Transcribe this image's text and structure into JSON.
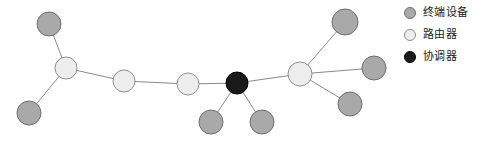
{
  "colors": {
    "end_device_fill": "#a9a9a9",
    "end_device_stroke": "#6e6e6e",
    "router_fill": "#ededed",
    "router_stroke": "#8f8f8f",
    "coordinator_fill": "#1a1a1a",
    "coordinator_stroke": "#000000",
    "link_stroke": "#8a8a8a",
    "background": "#ffffff",
    "text": "#1a1a1a"
  },
  "legend": {
    "items": [
      {
        "label": "终端设备",
        "type": "end-device"
      },
      {
        "label": "路由器",
        "type": "router"
      },
      {
        "label": "协调器",
        "type": "coordinator"
      }
    ]
  },
  "network": {
    "nodes": [
      {
        "id": "e1",
        "type": "end-device",
        "x": 49,
        "y": 24,
        "r": 12
      },
      {
        "id": "r1",
        "type": "router",
        "x": 66,
        "y": 68,
        "r": 11
      },
      {
        "id": "e2",
        "type": "end-device",
        "x": 29,
        "y": 113,
        "r": 12
      },
      {
        "id": "r2",
        "type": "router",
        "x": 124,
        "y": 81,
        "r": 11
      },
      {
        "id": "r3",
        "type": "router",
        "x": 188,
        "y": 84,
        "r": 11
      },
      {
        "id": "c1",
        "type": "coordinator",
        "x": 237,
        "y": 83,
        "r": 11
      },
      {
        "id": "e3",
        "type": "end-device",
        "x": 211,
        "y": 122,
        "r": 12
      },
      {
        "id": "e4",
        "type": "end-device",
        "x": 262,
        "y": 122,
        "r": 12
      },
      {
        "id": "r4",
        "type": "router",
        "x": 300,
        "y": 74,
        "r": 12
      },
      {
        "id": "e5",
        "type": "end-device",
        "x": 345,
        "y": 22,
        "r": 13
      },
      {
        "id": "e6",
        "type": "end-device",
        "x": 374,
        "y": 68,
        "r": 12
      },
      {
        "id": "e7",
        "type": "end-device",
        "x": 350,
        "y": 104,
        "r": 12
      }
    ],
    "links": [
      {
        "from": "e1",
        "to": "r1"
      },
      {
        "from": "e2",
        "to": "r1"
      },
      {
        "from": "r1",
        "to": "r2"
      },
      {
        "from": "r2",
        "to": "r3"
      },
      {
        "from": "r3",
        "to": "c1"
      },
      {
        "from": "c1",
        "to": "e3"
      },
      {
        "from": "c1",
        "to": "e4"
      },
      {
        "from": "c1",
        "to": "r4"
      },
      {
        "from": "r4",
        "to": "e5"
      },
      {
        "from": "r4",
        "to": "e6"
      },
      {
        "from": "r4",
        "to": "e7"
      }
    ]
  }
}
